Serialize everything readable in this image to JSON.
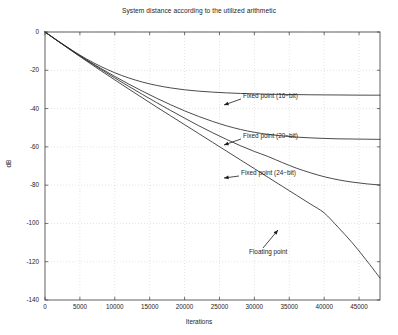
{
  "chart_data": {
    "type": "line",
    "title": "System distance according to the utilized arithmetic",
    "xlabel": "Iterations",
    "ylabel": "dB",
    "xlim": [
      0,
      48000
    ],
    "ylim": [
      -140,
      0
    ],
    "grid": true,
    "legend_position": "inline-annotations",
    "xticks": [
      0,
      5000,
      10000,
      15000,
      20000,
      25000,
      30000,
      35000,
      40000,
      45000
    ],
    "xticklabels": [
      "0",
      "5000",
      "10000",
      "15000",
      "20000",
      "25000",
      "30000",
      "35000",
      "40000",
      "45000"
    ],
    "yticks": [
      0,
      -20,
      -40,
      -60,
      -80,
      -100,
      -120,
      -140
    ],
    "yticklabels": [
      "0",
      "-20",
      "-40",
      "-60",
      "-80",
      "-100",
      "-120",
      "-140"
    ],
    "x": [
      0,
      2000,
      4000,
      6000,
      8000,
      10000,
      12000,
      14000,
      16000,
      18000,
      20000,
      22000,
      24000,
      26000,
      28000,
      30000,
      32000,
      34000,
      36000,
      38000,
      40000,
      42000,
      44000,
      46000,
      48000
    ],
    "series": [
      {
        "name": "Fixed point (16-bit)",
        "label": "Fixed point (16−bit)",
        "color": "#2b2b2b",
        "plateau_db": -33,
        "values": [
          0,
          -5.0,
          -9.8,
          -14.2,
          -18.0,
          -21.3,
          -24.0,
          -26.2,
          -27.9,
          -29.2,
          -30.2,
          -30.9,
          -31.4,
          -31.8,
          -32.1,
          -32.3,
          -32.5,
          -32.6,
          -32.7,
          -32.8,
          -32.85,
          -32.9,
          -32.95,
          -33.0,
          -33.0
        ]
      },
      {
        "name": "Fixed point (20-bit)",
        "label": "Fixed point (20−bit)",
        "color": "#2b2b2b",
        "plateau_db": -56,
        "values": [
          0,
          -5.1,
          -10.0,
          -14.7,
          -19.0,
          -23.2,
          -27.2,
          -31.0,
          -34.6,
          -38.0,
          -41.2,
          -44.1,
          -46.7,
          -49.0,
          -50.9,
          -52.4,
          -53.5,
          -54.3,
          -54.9,
          -55.3,
          -55.6,
          -55.8,
          -55.9,
          -56.0,
          -56.1
        ]
      },
      {
        "name": "Fixed point (24-bit)",
        "label": "Fixed point (24−bit)",
        "color": "#2b2b2b",
        "plateau_db": -80,
        "values": [
          0,
          -5.1,
          -10.1,
          -14.9,
          -19.5,
          -24.0,
          -28.4,
          -32.7,
          -36.9,
          -41.0,
          -45.0,
          -48.9,
          -52.6,
          -56.1,
          -59.4,
          -62.4,
          -65.1,
          -68.2,
          -71.1,
          -73.5,
          -75.6,
          -77.2,
          -78.4,
          -79.3,
          -79.9
        ]
      },
      {
        "name": "Floating point",
        "label": "Floating point",
        "color": "#2b2b2b",
        "plateau_db": -129,
        "values": [
          0,
          -5.2,
          -10.3,
          -15.3,
          -20.2,
          -25.0,
          -29.8,
          -34.5,
          -39.2,
          -43.8,
          -48.4,
          -53.0,
          -57.6,
          -62.2,
          -66.8,
          -71.4,
          -76.0,
          -80.6,
          -85.2,
          -89.8,
          -94.5,
          -102.0,
          -110.0,
          -119.0,
          -128.5
        ]
      }
    ],
    "annotations": [
      {
        "text": "Fixed point (16−bit)",
        "x_px": 243,
        "y_px": 96,
        "arrow_from_x": 241,
        "arrow_from_y": 99,
        "arrow_to_x": 224,
        "arrow_to_y": 105
      },
      {
        "text": "Fixed point (20−bit)",
        "x_px": 243,
        "y_px": 136,
        "arrow_from_x": 241,
        "arrow_from_y": 139,
        "arrow_to_x": 224,
        "arrow_to_y": 145
      },
      {
        "text": "Fixed point (24−bit)",
        "x_px": 241,
        "y_px": 173,
        "arrow_from_x": 239,
        "arrow_from_y": 176,
        "arrow_to_x": 224,
        "arrow_to_y": 178
      },
      {
        "text": "Floating point",
        "x_px": 249,
        "y_px": 252,
        "arrow_from_x": 263,
        "arrow_from_y": 248,
        "arrow_to_x": 278,
        "arrow_to_y": 230
      }
    ]
  }
}
